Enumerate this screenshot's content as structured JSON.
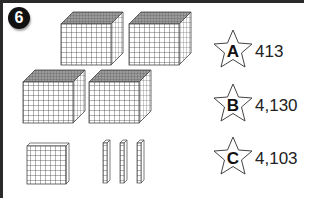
{
  "question": {
    "number": "6"
  },
  "blocks": {
    "thousands_cubes": 4,
    "hundreds_flats": 1,
    "tens_rods": 3,
    "ones_units": 0
  },
  "options": [
    {
      "letter": "A",
      "value": "413"
    },
    {
      "letter": "B",
      "value": "4,130"
    },
    {
      "letter": "C",
      "value": "4,103"
    }
  ],
  "colors": {
    "border": "#2a2a2a",
    "badge_bg": "#111111",
    "grid_line": "#444444",
    "cube_top": "#8a8a8a"
  }
}
